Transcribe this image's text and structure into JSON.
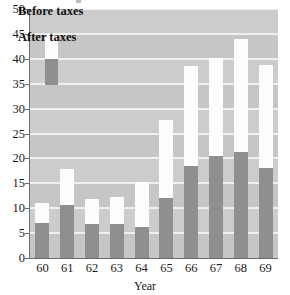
{
  "chart_data": {
    "type": "bar",
    "subtype": "stacked-vertical",
    "title": "",
    "xlabel": "Year",
    "ylabel": "",
    "categories": [
      "60",
      "61",
      "62",
      "63",
      "64",
      "65",
      "66",
      "67",
      "68",
      "69"
    ],
    "series": [
      {
        "name": "Before taxes",
        "color": "#fdfdfd",
        "values": [
          11.1,
          17.9,
          11.9,
          12.2,
          15.2,
          27.8,
          38.5,
          40.2,
          44.0,
          38.8
        ]
      },
      {
        "name": "After taxes",
        "color": "#8f8f8f",
        "values": [
          7.0,
          10.6,
          6.9,
          6.9,
          6.2,
          12.1,
          18.4,
          20.4,
          21.2,
          18.0
        ]
      }
    ],
    "ylim": [
      0,
      50
    ],
    "ytick_labels": [
      "0",
      "5",
      "10",
      "15",
      "20",
      "25",
      "30",
      "35",
      "40",
      "45",
      "50"
    ],
    "ytick_values": [
      0,
      5,
      10,
      15,
      20,
      25,
      30,
      35,
      40,
      45,
      50
    ],
    "grid": true,
    "grid_color": "#f0f0f0",
    "plot_background": "#c6c6c6",
    "legend_position": "upper-left",
    "legend_entries": [
      "Before taxes",
      "After taxes"
    ]
  },
  "axes": {
    "x_title": "Year",
    "y_title": ""
  }
}
